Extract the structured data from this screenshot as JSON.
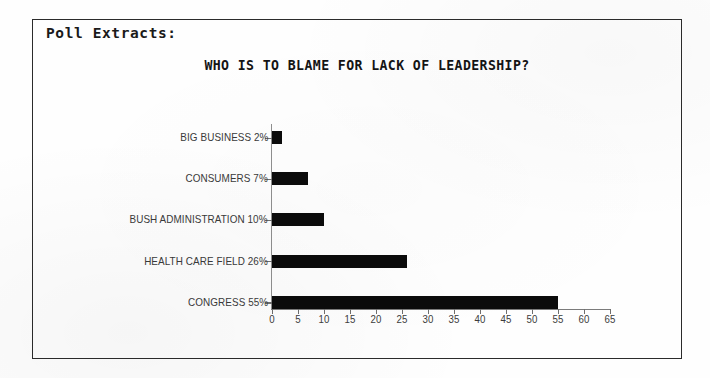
{
  "document": {
    "header_label": "Poll Extracts:"
  },
  "chart_data": {
    "type": "bar",
    "orientation": "horizontal",
    "title": "WHO IS TO BLAME FOR LACK OF LEADERSHIP?",
    "xlabel": "",
    "ylabel": "",
    "xlim": [
      0,
      65
    ],
    "grid": false,
    "legend": null,
    "bar_color": "#0b0b0b",
    "axis_color": "#7b7b7b",
    "categories": [
      "BIG BUSINESS",
      "CONSUMERS",
      "BUSH ADMINISTRATION",
      "HEALTH CARE FIELD",
      "CONGRESS"
    ],
    "values": [
      2,
      7,
      10,
      26,
      55
    ],
    "value_suffix": "%",
    "category_labels": [
      "BIG BUSINESS 2%",
      "CONSUMERS 7%",
      "BUSH ADMINISTRATION 10%",
      "HEALTH CARE FIELD 26%",
      "CONGRESS 55%"
    ],
    "xticks": [
      0,
      5,
      10,
      15,
      20,
      25,
      30,
      35,
      40,
      45,
      50,
      55,
      60,
      65
    ],
    "xtick_labels": [
      "0",
      "5",
      "10",
      "15",
      "20",
      "25",
      "30",
      "35",
      "40",
      "45",
      "50",
      "55",
      "60",
      "65"
    ]
  }
}
